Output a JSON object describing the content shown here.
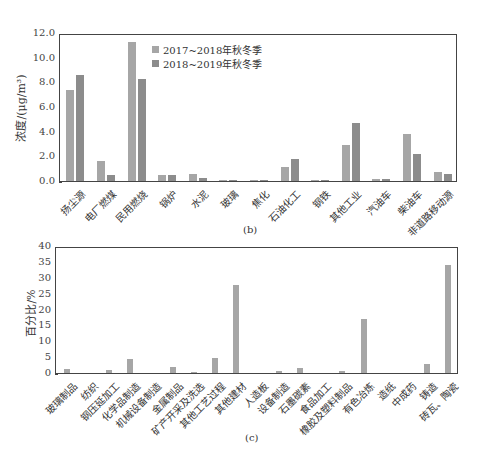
{
  "chart_data": [
    {
      "type": "bar",
      "title": "",
      "panel_label": "(b)",
      "xlabel": "",
      "ylabel": "浓度/(μg/m³)",
      "ylim": [
        0,
        12
      ],
      "yticks": [
        "0.0",
        "2.0",
        "4.0",
        "6.0",
        "8.0",
        "10.0",
        "12.0"
      ],
      "grid": false,
      "legend_position": "upper-center",
      "categories": [
        "扬尘源",
        "电厂燃煤",
        "民用燃烧",
        "锅炉",
        "水泥",
        "玻璃",
        "焦化",
        "石油化工",
        "钢铁",
        "其他工业",
        "汽油车",
        "柴油车",
        "非道路移动源"
      ],
      "series": [
        {
          "name": "2017~2018年秋冬季",
          "color": "#a6a6a6",
          "values": [
            7.4,
            1.6,
            11.3,
            0.45,
            0.55,
            0.02,
            0.02,
            1.1,
            0.02,
            2.9,
            0.2,
            3.8,
            0.7
          ]
        },
        {
          "name": "2018~2019年秋冬季",
          "color": "#8c8c8c",
          "values": [
            8.6,
            0.5,
            8.3,
            0.5,
            0.25,
            0.02,
            0.02,
            1.75,
            0.05,
            4.7,
            0.2,
            2.2,
            0.6
          ]
        }
      ]
    },
    {
      "type": "bar",
      "title": "",
      "panel_label": "(c)",
      "xlabel": "",
      "ylabel": "百分比/%",
      "ylim": [
        0,
        40
      ],
      "yticks": [
        "0",
        "5",
        "10",
        "15",
        "20",
        "25",
        "30",
        "35",
        "40"
      ],
      "grid": false,
      "categories": [
        "玻璃制品",
        "纺织",
        "钢压延加工",
        "化学品制造",
        "机械设备制造",
        "金属制品",
        "矿产开采及洗选",
        "其他工艺过程",
        "其他建材",
        "人造板",
        "设备制造",
        "石墨碳素",
        "食品加工",
        "橡胶及塑料制品",
        "有色冶炼",
        "造纸",
        "中成药",
        "铸造",
        "砖瓦、陶瓷"
      ],
      "series": [
        {
          "name": "百分比",
          "color": "#a6a6a6",
          "values": [
            1.3,
            0,
            1.0,
            4.4,
            0,
            2.0,
            0.4,
            4.7,
            27.6,
            0,
            0.5,
            1.7,
            0,
            0.6,
            17.0,
            0,
            0,
            2.8,
            34.0
          ]
        }
      ]
    }
  ]
}
